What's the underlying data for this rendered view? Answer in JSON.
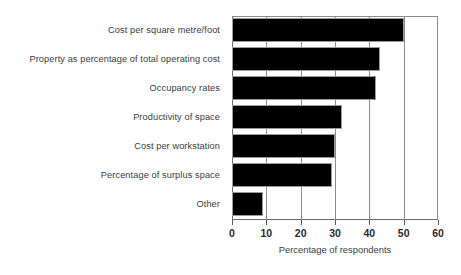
{
  "chart_data": {
    "type": "bar",
    "orientation": "horizontal",
    "title": "",
    "xlabel": "Percentage of respondents",
    "ylabel": "",
    "xlim": [
      0,
      60
    ],
    "xticks": [
      0,
      10,
      20,
      30,
      40,
      50,
      60
    ],
    "grid": true,
    "legend": false,
    "bar_color": "#000000",
    "categories": [
      "Cost per square metre/foot",
      "Property as percentage of total operating cost",
      "Occupancy rates",
      "Productivity of space",
      "Cost per workstation",
      "Percentage of surplus space",
      "Other"
    ],
    "values": [
      50,
      43,
      42,
      32,
      30,
      29,
      9
    ]
  },
  "axis": {
    "x_title": "Percentage of respondents",
    "tick_labels": [
      "0",
      "10",
      "20",
      "30",
      "40",
      "50",
      "60"
    ]
  },
  "bars": [
    {
      "label": "Cost per square metre/foot",
      "value": 50
    },
    {
      "label": "Property as percentage of total operating cost",
      "value": 43
    },
    {
      "label": "Occupancy rates",
      "value": 42
    },
    {
      "label": "Productivity of space",
      "value": 32
    },
    {
      "label": "Cost per workstation",
      "value": 30
    },
    {
      "label": "Percentage of surplus space",
      "value": 29
    },
    {
      "label": "Other",
      "value": 9
    }
  ]
}
